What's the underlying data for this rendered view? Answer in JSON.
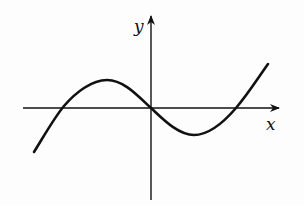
{
  "diagram": {
    "type": "function-graph",
    "axes": {
      "x_label": "x",
      "y_label": "y"
    },
    "curve": {
      "shape": "cubic",
      "x_intercepts": [
        "negative",
        "origin",
        "positive"
      ],
      "local_max": "left of y-axis, above x-axis",
      "local_min": "right of y-axis, below x-axis"
    },
    "colors": {
      "stroke": "#111111",
      "background": "#fdfdfd"
    }
  }
}
